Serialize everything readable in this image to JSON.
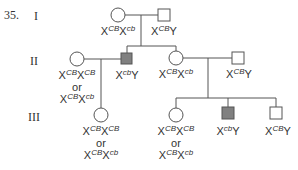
{
  "question_number": "35.",
  "generations": [
    "I",
    "II",
    "III"
  ],
  "colors": {
    "line": "#555555",
    "affected_fill": "#808080",
    "unaffected_fill": "#ffffff"
  },
  "individuals": {
    "I1": {
      "sex": "female",
      "affected": false,
      "genotype": [
        {
          "base": "X",
          "sup": "CB"
        },
        {
          "base": "X",
          "sup": "cb"
        }
      ]
    },
    "I2": {
      "sex": "male",
      "affected": false,
      "genotype": [
        {
          "base": "X",
          "sup": "CB"
        },
        {
          "base": "Y",
          "sup": ""
        }
      ]
    },
    "II1": {
      "sex": "female",
      "affected": false,
      "genotype_options": [
        "X^CB X^CB",
        "X^CB X^cb"
      ],
      "or": "or",
      "line1": [
        {
          "base": "X",
          "sup": "CB"
        },
        {
          "base": "X",
          "sup": "CB"
        }
      ],
      "line3": [
        {
          "base": "X",
          "sup": "CB"
        },
        {
          "base": "X",
          "sup": "cb"
        }
      ]
    },
    "II2": {
      "sex": "male",
      "affected": true,
      "genotype": [
        {
          "base": "X",
          "sup": "cb"
        },
        {
          "base": "Y",
          "sup": ""
        }
      ]
    },
    "II3": {
      "sex": "female",
      "affected": false,
      "genotype": [
        {
          "base": "X",
          "sup": "CB"
        },
        {
          "base": "X",
          "sup": "cb"
        }
      ]
    },
    "II4": {
      "sex": "male",
      "affected": false,
      "genotype": [
        {
          "base": "X",
          "sup": "CB"
        },
        {
          "base": "Y",
          "sup": ""
        }
      ]
    },
    "III1": {
      "sex": "female",
      "affected": false,
      "or": "or",
      "line1": [
        {
          "base": "X",
          "sup": "CB"
        },
        {
          "base": "X",
          "sup": "CB"
        }
      ],
      "line3": [
        {
          "base": "X",
          "sup": "CB"
        },
        {
          "base": "X",
          "sup": "cb"
        }
      ]
    },
    "III2": {
      "sex": "female",
      "affected": false,
      "or": "or",
      "line1": [
        {
          "base": "X",
          "sup": "CB"
        },
        {
          "base": "X",
          "sup": "CB"
        }
      ],
      "line3": [
        {
          "base": "X",
          "sup": "CB"
        },
        {
          "base": "X",
          "sup": "cb"
        }
      ]
    },
    "III3": {
      "sex": "male",
      "affected": true,
      "genotype": [
        {
          "base": "X",
          "sup": "cb"
        },
        {
          "base": "Y",
          "sup": ""
        }
      ]
    },
    "III4": {
      "sex": "male",
      "affected": false,
      "genotype": [
        {
          "base": "X",
          "sup": "CB"
        },
        {
          "base": "Y",
          "sup": ""
        }
      ]
    }
  }
}
